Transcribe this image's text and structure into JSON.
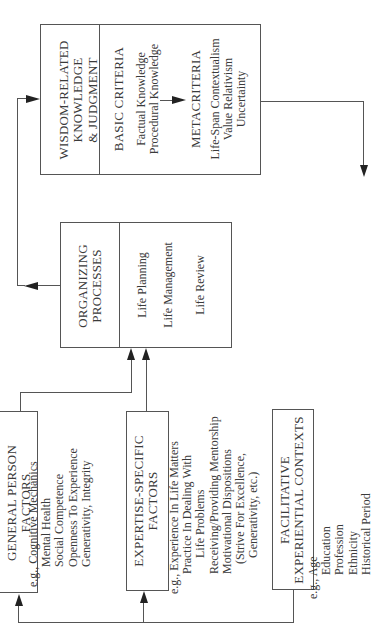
{
  "diagram": {
    "orientation": "rotated 90 degrees counter-clockwise",
    "wisdom": {
      "title_lines": [
        "WISDOM-RELATED",
        "KNOWLEDGE",
        "& JUDGMENT"
      ],
      "basic": {
        "title": "BASIC CRITERIA",
        "items": [
          "Factual Knowledge",
          "Procedural Knowledge"
        ]
      },
      "meta": {
        "title": "METACRITERIA",
        "items": [
          "Life-Span Contextualism",
          "Value Relativism",
          "Uncertainty"
        ]
      }
    },
    "organizing": {
      "title_lines": [
        "ORGANIZING",
        "PROCESSES"
      ],
      "items": [
        "Life Planning",
        "Life Management",
        "Life Review"
      ]
    },
    "general": {
      "title_lines": [
        "GENERAL PERSON",
        "FACTORS"
      ],
      "eg_label": "e.g.,",
      "items": [
        "Cognitive Mechanics",
        "Mental Health",
        "Social Competence",
        "Openness To Experience",
        "Generativity, Integrity"
      ]
    },
    "expertise": {
      "title_lines": [
        "EXPERTISE-SPECIFIC",
        "FACTORS"
      ],
      "eg_label": "e.g.,",
      "items": [
        "Experience In Life Matters",
        "Practice In Dealing With",
        "Life Problems",
        "Receiving/Providing Mentorship",
        "Motivational Dispositions",
        "(Strive For Excellence,",
        "Generativity, etc.)"
      ]
    },
    "facilitative": {
      "title_lines": [
        "FACILITATIVE",
        "EXPERIENTIAL CONTEXTS"
      ],
      "eg_label": "e.g.,",
      "items": [
        "Age",
        "Education",
        "Profession",
        "Ethnicity",
        "Historical Period"
      ]
    }
  },
  "colors": {
    "line": "#555555",
    "arrowhead": "#222222",
    "text": "#3a3a3a",
    "background": "#ffffff"
  }
}
